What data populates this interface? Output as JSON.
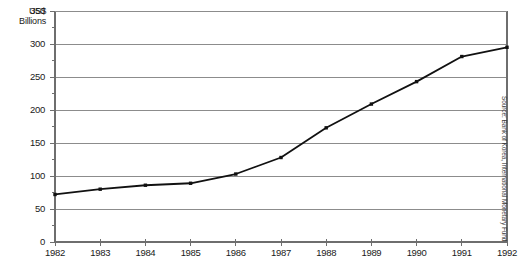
{
  "chart_data": {
    "type": "line",
    "title": "",
    "subtitle": "",
    "xlabel": "",
    "ylabel": "US$ Billions",
    "categories": [
      "1982",
      "1983",
      "1984",
      "1985",
      "1986",
      "1987",
      "1988",
      "1989",
      "1990",
      "1991",
      "1992"
    ],
    "values": [
      72,
      80,
      86,
      89,
      103,
      128,
      173,
      209,
      243,
      281,
      295
    ],
    "series": [
      {
        "name": "US$ Billions",
        "values": [
          72,
          80,
          86,
          89,
          103,
          128,
          173,
          209,
          243,
          281,
          295
        ]
      }
    ],
    "ylim": [
      0,
      350
    ],
    "ytick_labels": [
      "0",
      "50",
      "100",
      "150",
      "200",
      "250",
      "300",
      "350"
    ],
    "ytick_values": [
      0,
      50,
      100,
      150,
      200,
      250,
      300,
      350
    ],
    "yminor_tick_values": [
      25,
      75,
      125,
      175,
      225,
      275,
      325
    ],
    "xtick_labels": [
      "1982",
      "1983",
      "1984",
      "1985",
      "1986",
      "1987",
      "1988",
      "1989",
      "1990",
      "1991",
      "1992"
    ],
    "grid": true,
    "grid_axis": "y",
    "legend": false,
    "legend_position": "none",
    "marker": "square",
    "line_color": "#111111",
    "grid_color": "#8c8c8c",
    "axis_color": "#6e6e6e",
    "annotations": [
      "Source: Bank of Korea, International Monetary Fund"
    ]
  },
  "axis": {
    "unit_label_line1": "US$",
    "unit_label_line2": "Billions"
  },
  "source": {
    "text": "Source: Bank of Korea, International Monetary Fund"
  }
}
